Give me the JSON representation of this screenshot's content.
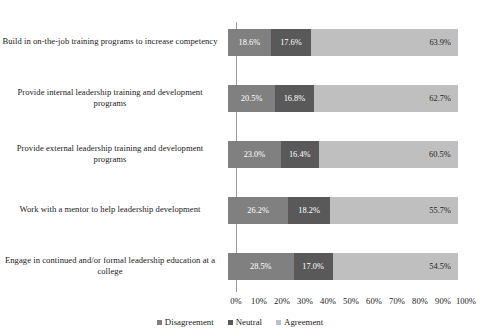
{
  "chart_data": {
    "type": "bar",
    "subtype": "horizontal-100-percent-stacked",
    "title": "",
    "xlabel": "",
    "ylabel": "",
    "xlim": [
      0,
      100
    ],
    "grid": false,
    "legend_position": "bottom-center",
    "categories": [
      "Build in on-the-job training programs to increase competency",
      "Provide internal leadership training and development programs",
      "Provide external leadership training and development programs",
      "Work with a mentor to help leadership development",
      "Engage in continued and/or formal leadership education at a college"
    ],
    "series": [
      {
        "name": "Disagreement",
        "color": "#808080",
        "values": [
          18.6,
          20.5,
          23.0,
          26.2,
          28.5
        ],
        "labels": [
          "18.6%",
          "20.5%",
          "23.0%",
          "26.2%",
          "28.5%"
        ]
      },
      {
        "name": "Neutral",
        "color": "#595959",
        "values": [
          17.6,
          16.8,
          16.4,
          18.2,
          17.0
        ],
        "labels": [
          "17.6%",
          "16.8%",
          "16.4%",
          "18.2%",
          "17.0%"
        ]
      },
      {
        "name": "Agreement",
        "color": "#bfbfbf",
        "values": [
          63.9,
          62.7,
          60.5,
          55.7,
          54.5
        ],
        "labels": [
          "63.9%",
          "62.7%",
          "60.5%",
          "55.7%",
          "54.5%"
        ]
      }
    ],
    "xticks": [
      0,
      10,
      20,
      30,
      40,
      50,
      60,
      70,
      80,
      90,
      100
    ],
    "xticklabels": [
      "0%",
      "10%",
      "20%",
      "30%",
      "40%",
      "50%",
      "60%",
      "70%",
      "80%",
      "90%",
      "100%"
    ]
  }
}
